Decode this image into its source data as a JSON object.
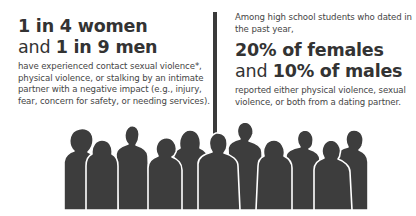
{
  "left_stat": {
    "headline_line1_bold": "1 in 4 women",
    "headline_line2_prefix": "and ",
    "headline_line2_bold": "1 in 9 men",
    "description": "have experienced contact sexual violence*, physical violence, or stalking by an intimate partner with a negative impact (e.g., injury, fear, concern for safety, or needing services)."
  },
  "right_stat": {
    "intro": "Among high school students who dated in the past year,",
    "headline_line1_bold": "20% of females",
    "headline_line2_prefix": "and ",
    "headline_line2_bold": "10% of males",
    "description": "reported either physical violence, sexual violence, or both from a dating partner."
  },
  "illustration": {
    "icon": "crowd-silhouette-icon",
    "figure_count": 12,
    "fill_color": "#3d3d3d",
    "outline_color": "#ffffff"
  },
  "colors": {
    "text_dark": "#333333",
    "divider": "#3a3a3a",
    "background": "#ffffff"
  }
}
